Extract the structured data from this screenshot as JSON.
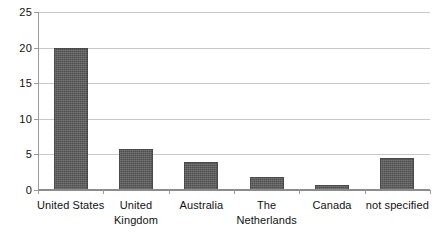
{
  "chart_data": {
    "type": "bar",
    "title": "",
    "subtitle": "",
    "xlabel": "",
    "ylabel": "",
    "categories": [
      "United States",
      "United Kingdom",
      "Australia",
      "The Netherlands",
      "Canada",
      "not specified"
    ],
    "values": [
      20,
      5.8,
      4,
      1.8,
      0.7,
      4.5
    ],
    "ylim": [
      0,
      25
    ],
    "yticks": [
      0,
      5,
      10,
      15,
      20,
      25
    ],
    "ytick_labels": [
      "0",
      "5",
      "10",
      "15",
      "20",
      "25"
    ],
    "grid": true,
    "legend": false,
    "legend_position": "none",
    "bar_color": "#585858",
    "gridline_color": "#c9c9c9",
    "axis_color": "#9a9a9a",
    "background_color": "#ffffff"
  }
}
